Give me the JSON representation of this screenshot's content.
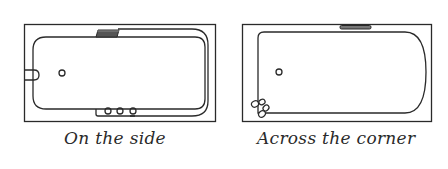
{
  "figure": {
    "line_color": "#2a2a2a",
    "background": "#ffffff",
    "panels": [
      {
        "id": "on-the-side",
        "caption": "On the side",
        "fixtures": {
          "grip_handle": "top",
          "overflow_drain": "left-center",
          "taps": "side-bottom",
          "tap_count": 3,
          "plug_hole": "left"
        }
      },
      {
        "id": "across-the-corner",
        "caption": "Across the corner",
        "fixtures": {
          "grip_handle": "top",
          "taps": "bottom-left-corner",
          "tap_count": 3,
          "plug_hole": "left"
        }
      }
    ]
  }
}
